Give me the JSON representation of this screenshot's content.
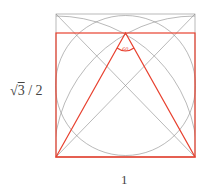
{
  "labels": {
    "height_radicand": "3",
    "height_prefix": "√",
    "height_suffix": "/ 2",
    "width": "1"
  },
  "colors": {
    "construction": "#8a8a8a",
    "highlight": "#e8412f"
  },
  "angle_mark": "60°"
}
